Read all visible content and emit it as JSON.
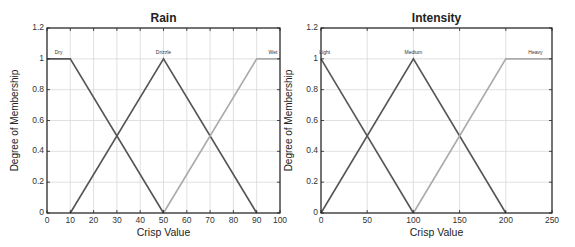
{
  "chart_data": [
    {
      "type": "line",
      "title": "Rain",
      "xlabel": "Crisp Value",
      "ylabel": "Degree of Membership",
      "xlim": [
        0,
        100
      ],
      "ylim": [
        0,
        1.2
      ],
      "xticks": [
        0,
        10,
        20,
        30,
        40,
        50,
        60,
        70,
        80,
        90,
        100
      ],
      "yticks": [
        0,
        0.2,
        0.4,
        0.6,
        0.8,
        1,
        1.2
      ],
      "ytick_labels": [
        "0",
        "0.2",
        "0.4",
        "0.6",
        "0.8",
        "1",
        "1.2"
      ],
      "grid": true,
      "series": [
        {
          "name": "Dry",
          "x": [
            0,
            10,
            50
          ],
          "y": [
            1,
            1,
            0
          ],
          "color": "#555555",
          "label_x": 5
        },
        {
          "name": "Drizzle",
          "x": [
            10,
            50,
            90
          ],
          "y": [
            0,
            1,
            0
          ],
          "color": "#555555",
          "label_x": 50
        },
        {
          "name": "Wet",
          "x": [
            50,
            90,
            100
          ],
          "y": [
            0,
            1,
            1
          ],
          "color": "#aaaaaa",
          "label_x": 97
        }
      ]
    },
    {
      "type": "line",
      "title": "Intensity",
      "xlabel": "Crisp Value",
      "ylabel": "Degree of Membership",
      "xlim": [
        0,
        250
      ],
      "ylim": [
        0,
        1.2
      ],
      "xticks": [
        0,
        50,
        100,
        150,
        200,
        250
      ],
      "yticks": [
        0,
        0.2,
        0.4,
        0.6,
        0.8,
        1,
        1.2
      ],
      "ytick_labels": [
        "0",
        "0.2",
        "0.4",
        "0.6",
        "0.8",
        "1",
        "1.2"
      ],
      "grid": true,
      "series": [
        {
          "name": "Light",
          "x": [
            0,
            100
          ],
          "y": [
            1,
            0
          ],
          "color": "#555555",
          "label_x": 4
        },
        {
          "name": "Medium",
          "x": [
            0,
            100,
            200
          ],
          "y": [
            0,
            1,
            0
          ],
          "color": "#555555",
          "label_x": 100
        },
        {
          "name": "Heavy",
          "x": [
            100,
            200,
            250
          ],
          "y": [
            0,
            1,
            1
          ],
          "color": "#aaaaaa",
          "label_x": 232
        }
      ]
    }
  ],
  "layout": [
    {
      "left": 47,
      "top": 28,
      "width": 233,
      "height": 185
    },
    {
      "left": 321,
      "top": 28,
      "width": 231,
      "height": 185
    }
  ]
}
